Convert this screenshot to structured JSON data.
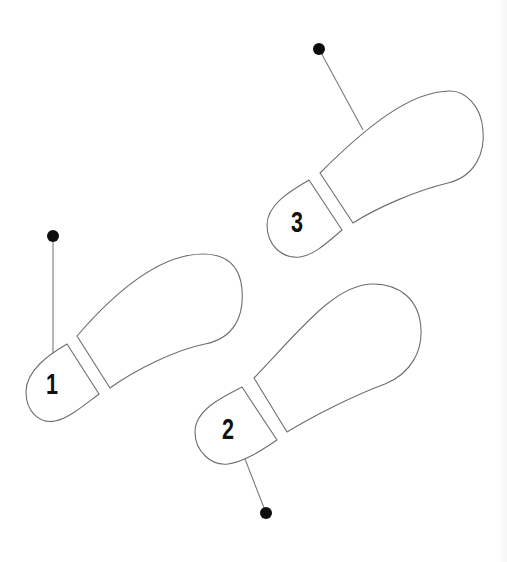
{
  "diagram": {
    "title": "",
    "colors": {
      "background": "#ffffff",
      "outline": "#6e6e6e",
      "leader_line": "#7a7a7a",
      "pin": "#0d0d0d",
      "numeral": "#111111"
    },
    "steps": [
      {
        "label": "1",
        "heel_path": "M67,344 L99,394 C88,402 70,418 55,421 C40,424 26,412 26,392 C26,370 50,354 67,344 Z",
        "sole_path": "M77,336 L110,388 C135,370 175,350 205,344 C235,338 244,315 242,290 C240,262 222,254 203,254 C160,254 115,292 77,336 Z",
        "pin": {
          "cx": 53,
          "cy": 236,
          "r": 6
        },
        "leader": {
          "x1": 53,
          "y1": 236,
          "x2": 53,
          "y2": 354
        },
        "label_pos": {
          "x": 52,
          "y": 384
        }
      },
      {
        "label": "2",
        "heel_path": "M242,387 L277,440 C265,448 245,462 228,464 C212,466 195,452 195,432 C195,410 222,397 242,387 Z",
        "sole_path": "M254,378 L287,432 C315,415 355,395 385,384 C412,373 422,350 421,330 C420,300 400,284 373,284 C335,284 300,330 254,378 Z",
        "pin": {
          "cx": 266,
          "cy": 513,
          "r": 6
        },
        "leader": {
          "x1": 245,
          "y1": 459,
          "x2": 266,
          "y2": 513
        },
        "label_pos": {
          "x": 228,
          "y": 429
        }
      },
      {
        "label": "3",
        "heel_path": "M309,180 L342,230 C330,240 315,255 300,257 C282,259 267,245 267,225 C267,204 292,190 309,180 Z",
        "sole_path": "M320,173 L353,223 C378,207 418,190 448,183 C476,176 485,152 483,130 C481,105 465,91 450,91 C410,91 365,128 320,173 Z",
        "pin": {
          "cx": 319,
          "cy": 49,
          "r": 6
        },
        "leader": {
          "x1": 319,
          "y1": 49,
          "x2": 363,
          "y2": 130
        },
        "label_pos": {
          "x": 297,
          "y": 222
        }
      }
    ]
  }
}
